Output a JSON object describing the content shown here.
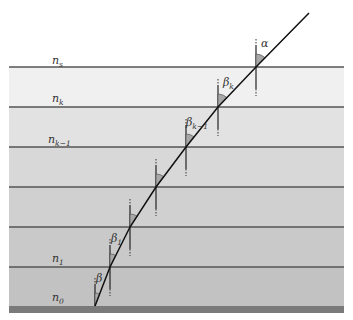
{
  "diagram": {
    "layers": [
      {
        "label_base": "n",
        "label_sub": "s",
        "top": 67,
        "bottom": 107,
        "color": "#f0f0f0"
      },
      {
        "label_base": "n",
        "label_sub": "k",
        "top": 107,
        "bottom": 147,
        "color": "#e2e2e2"
      },
      {
        "label_base": "n",
        "label_sub": "k−1",
        "top": 147,
        "bottom": 187,
        "color": "#d8d8d8"
      },
      {
        "label_base": "",
        "label_sub": "",
        "top": 187,
        "bottom": 227,
        "color": "#d0d0d0"
      },
      {
        "label_base": "",
        "label_sub": "",
        "top": 227,
        "bottom": 267,
        "color": "#c9c9c9"
      },
      {
        "label_base": "n",
        "label_sub": "1",
        "top": 267,
        "bottom": 306,
        "color": "#c2c2c2"
      }
    ],
    "layer_labels": [
      {
        "base": "n",
        "sub": "s",
        "x": 52,
        "y": 64
      },
      {
        "base": "n",
        "sub": "k",
        "x": 52,
        "y": 102
      },
      {
        "base": "n",
        "sub": "k−1",
        "x": 48,
        "y": 143
      },
      {
        "base": "n",
        "sub": "1",
        "x": 52,
        "y": 262
      },
      {
        "base": "n",
        "sub": "0",
        "x": 52,
        "y": 301
      }
    ],
    "angle_labels": [
      {
        "base": "α",
        "sub": "",
        "x": 261,
        "y": 47
      },
      {
        "base": "β",
        "sub": "k",
        "x": 223,
        "y": 86
      },
      {
        "base": "β",
        "sub": "k−1",
        "x": 186,
        "y": 126
      },
      {
        "base": "β",
        "sub": "1",
        "x": 111,
        "y": 242
      },
      {
        "base": "β",
        "sub": "",
        "x": 96,
        "y": 282
      }
    ],
    "ray_points": [
      [
        309,
        13
      ],
      [
        256,
        67
      ],
      [
        218,
        107
      ],
      [
        186,
        147
      ],
      [
        156,
        187
      ],
      [
        130,
        227
      ],
      [
        110,
        267
      ],
      [
        95,
        306
      ]
    ],
    "colors": {
      "ray": "#111111",
      "boundary": "#555555",
      "substrate": "#7a7a7a",
      "angle_fill": "#a8a8a8"
    }
  }
}
